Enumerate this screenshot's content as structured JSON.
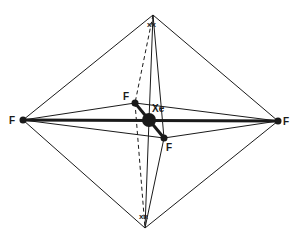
{
  "diagram": {
    "type": "molecular-geometry",
    "central_atom": {
      "label": "Xe",
      "x": 149,
      "y": 120
    },
    "apex_top": {
      "x": 153,
      "y": 15
    },
    "apex_bottom": {
      "x": 145,
      "y": 228
    },
    "fluorines": [
      {
        "label": "F",
        "x": 23,
        "y": 120,
        "position": "left"
      },
      {
        "label": "F",
        "x": 278,
        "y": 121,
        "position": "right"
      },
      {
        "label": "F",
        "x": 135,
        "y": 103,
        "position": "back"
      },
      {
        "label": "F",
        "x": 164,
        "y": 138,
        "position": "front"
      }
    ],
    "lone_pairs": [
      {
        "label": "xx",
        "x": 153,
        "y": 24,
        "position": "top"
      },
      {
        "label": "xx",
        "x": 145,
        "y": 216,
        "position": "bottom"
      }
    ],
    "colors": {
      "line": "#1a1a1a",
      "background": "#ffffff"
    }
  }
}
